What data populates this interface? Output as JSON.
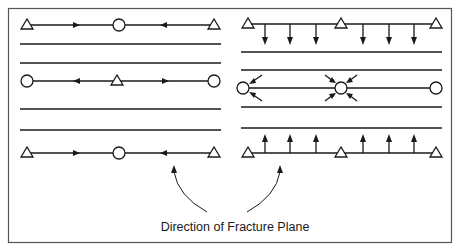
{
  "figure": {
    "caption": "Direction of Fracture Plane",
    "stroke_color": "#1a1a1a",
    "frame_color": "#555555",
    "background": "#ffffff"
  },
  "left_panel": {
    "description": "Alternating supports with horizontal arrows pointing toward fracture points",
    "rows": [
      {
        "y": 25,
        "ends": [
          "triangle",
          "triangle"
        ],
        "middle": "circle",
        "arrows": [
          "right",
          "left"
        ]
      },
      {
        "y": 81,
        "ends": [
          "circle",
          "circle"
        ],
        "middle": "triangle",
        "arrows": [
          "left",
          "right"
        ]
      },
      {
        "y": 153,
        "ends": [
          "triangle",
          "triangle"
        ],
        "middle": "circle",
        "arrows": [
          "right",
          "left"
        ]
      }
    ],
    "plain_lines_y": [
      44,
      63,
      109,
      130
    ]
  },
  "right_panel": {
    "description": "Supports with perpendicular arrows converging on middle row nodes",
    "rows": [
      {
        "y": 24,
        "nodes": [
          "triangle",
          "triangle",
          "triangle"
        ],
        "arrows": "down"
      },
      {
        "y": 88,
        "nodes": [
          "circle",
          "circle",
          "circle"
        ],
        "arrows": "converging-diagonal"
      },
      {
        "y": 153,
        "nodes": [
          "triangle",
          "triangle",
          "triangle"
        ],
        "arrows": "up"
      }
    ],
    "plain_lines_y": [
      52,
      70,
      107,
      128
    ]
  },
  "legend": {
    "symbols": [
      {
        "shape": "triangle",
        "name": "triangle-node"
      },
      {
        "shape": "circle",
        "name": "circle-node"
      }
    ]
  }
}
